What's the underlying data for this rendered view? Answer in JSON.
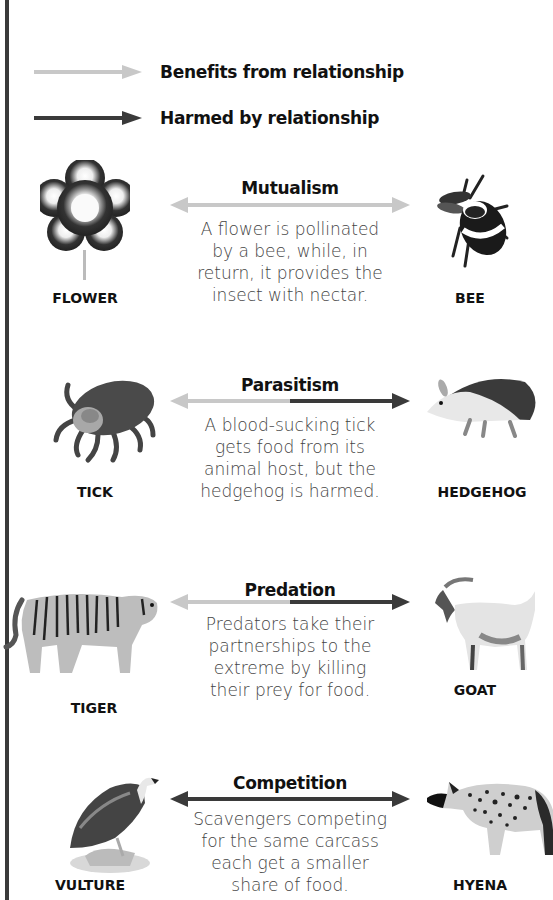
{
  "legend": {
    "benefit_label": "Benefits from relationship",
    "harmed_label": "Harmed by relationship",
    "benefit_color": "#c8c8c8",
    "harmed_color": "#3a3a3a"
  },
  "relationships": [
    {
      "title": "Mutualism",
      "description_lines": [
        "A flower is pollinated",
        "by a bee, while, in",
        "return, it provides the",
        "insect with nectar."
      ],
      "left_animal": "FLOWER",
      "right_animal": "BEE",
      "arrow": "benefit-both"
    },
    {
      "title": "Parasitism",
      "description_lines": [
        "A blood-sucking tick",
        "gets food from its",
        "animal host, but the",
        "hedgehog is harmed."
      ],
      "left_animal": "TICK",
      "right_animal": "HEDGEHOG",
      "arrow": "benefit-left-harm-right"
    },
    {
      "title": "Predation",
      "description_lines": [
        "Predators take their",
        "partnerships to the",
        "extreme by killing",
        "their prey for food."
      ],
      "left_animal": "TIGER",
      "right_animal": "GOAT",
      "arrow": "benefit-left-harm-right"
    },
    {
      "title": "Competition",
      "description_lines": [
        "Scavengers competing",
        "for the same carcass",
        "each get a smaller",
        "share of food."
      ],
      "left_animal": "VULTURE",
      "right_animal": "HYENA",
      "arrow": "harm-both"
    }
  ]
}
